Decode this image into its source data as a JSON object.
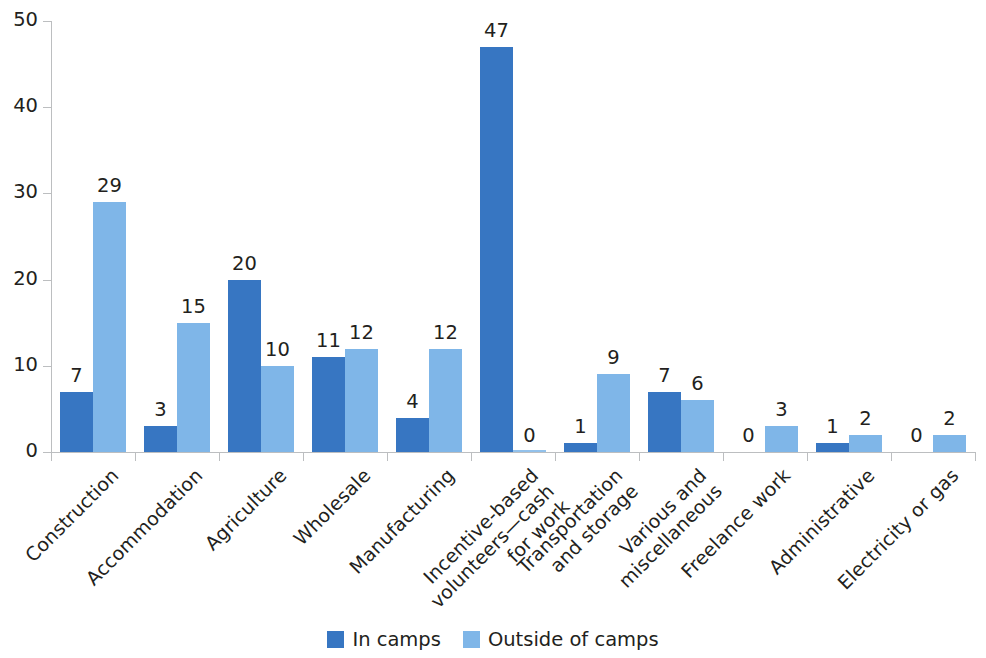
{
  "chart_data": {
    "type": "bar",
    "title": "",
    "subtitle": "",
    "xlabel": "",
    "ylabel": "",
    "ylim": [
      0,
      50
    ],
    "yticks": [
      0,
      10,
      20,
      30,
      40,
      50
    ],
    "grid": false,
    "legend_position": "bottom",
    "grouping": "grouped",
    "categories": [
      "Construction",
      "Accommodation",
      "Agriculture",
      "Wholesale",
      "Manufacturing",
      "Incentive-based\nvolunteers—cash\nfor work",
      "Transportation\nand storage",
      "Various and\nmiscellaneous",
      "Freelance work",
      "Administrative",
      "Electricity or gas"
    ],
    "series": [
      {
        "name": "In camps",
        "color": "#3776c2",
        "values": [
          7,
          3,
          20,
          11,
          4,
          47,
          1,
          7,
          0,
          1,
          0
        ]
      },
      {
        "name": "Outside of camps",
        "color": "#7fb6e8",
        "values": [
          29,
          15,
          10,
          12,
          12,
          0,
          9,
          6,
          3,
          2,
          2
        ]
      }
    ],
    "data_labels": true,
    "axis_color": "#bcbec0",
    "text_color": "#231f20",
    "background": "#ffffff"
  },
  "legend": {
    "items": [
      {
        "label": "In camps",
        "swatch": "dark"
      },
      {
        "label": "Outside of camps",
        "swatch": "light"
      }
    ]
  }
}
